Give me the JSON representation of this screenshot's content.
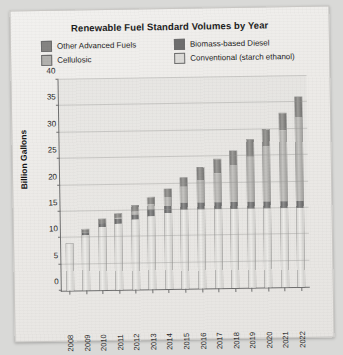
{
  "chart_data": {
    "type": "bar",
    "title": "Renewable Fuel Standard Volumes by Year",
    "xlabel": "",
    "ylabel": "Billion Gallons",
    "ylim": [
      0,
      40
    ],
    "yticks": [
      0,
      5,
      10,
      15,
      20,
      25,
      30,
      35,
      40
    ],
    "grid": true,
    "legend_position": "top",
    "stacked": true,
    "categories": [
      "2008",
      "2009",
      "2010",
      "2011",
      "2012",
      "2013",
      "2014",
      "2015",
      "2016",
      "2017",
      "2018",
      "2019",
      "2020",
      "2021",
      "2022"
    ],
    "series": [
      {
        "name": "Conventional (starch ethanol)",
        "color": "#dcdbd8",
        "values": [
          9.0,
          10.5,
          12.0,
          12.6,
          13.2,
          13.8,
          14.4,
          15.0,
          15.0,
          15.0,
          15.0,
          15.0,
          15.0,
          15.0,
          15.0
        ]
      },
      {
        "name": "Biomass-based Diesel",
        "color": "#6e6e6e",
        "values": [
          0.0,
          0.5,
          0.65,
          0.8,
          1.0,
          1.28,
          1.28,
          1.28,
          1.28,
          1.28,
          1.28,
          1.28,
          1.28,
          1.28,
          1.28
        ]
      },
      {
        "name": "Cellulosic",
        "color": "#b2b1ae",
        "values": [
          0.0,
          0.0,
          0.1,
          0.25,
          0.5,
          1.0,
          1.75,
          3.0,
          4.25,
          5.5,
          7.0,
          8.5,
          10.5,
          13.5,
          16.0
        ]
      },
      {
        "name": "Other Advanced Fuels",
        "color": "#858482",
        "values": [
          0.0,
          0.6,
          0.75,
          0.85,
          1.3,
          1.42,
          1.57,
          1.72,
          2.47,
          2.72,
          2.72,
          3.22,
          3.22,
          3.22,
          3.72
        ]
      }
    ],
    "totals": [
      9.0,
      11.6,
      13.5,
      14.5,
      16.0,
      17.5,
      19.0,
      21.0,
      23.0,
      24.5,
      26.0,
      28.0,
      30.0,
      33.0,
      36.0
    ]
  },
  "legend": {
    "items": [
      {
        "label": "Other Advanced Fuels",
        "swatch": "#858482"
      },
      {
        "label": "Biomass-based Diesel",
        "swatch": "#6e6e6e"
      },
      {
        "label": "Cellulosic",
        "swatch": "#b2b1ae"
      },
      {
        "label": "Conventional (starch ethanol)",
        "swatch": "#dcdbd8"
      }
    ]
  }
}
